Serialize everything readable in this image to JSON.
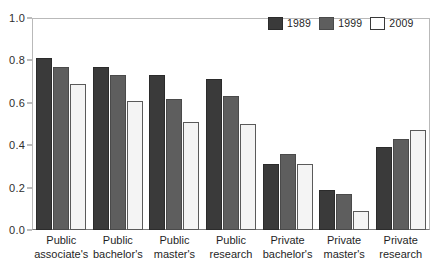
{
  "chart_data": {
    "type": "bar",
    "title": "",
    "xlabel": "",
    "ylabel": "",
    "ylim": [
      0.0,
      1.0
    ],
    "ytick_labels": [
      "1.0",
      "0.8",
      "0.6",
      "0.4",
      "0.2",
      "0.0"
    ],
    "ytick_values": [
      1.0,
      0.8,
      0.6,
      0.4,
      0.2,
      0.0
    ],
    "grid": false,
    "legend_position": "top-right",
    "categories": [
      "Public associate's",
      "Public bachelor's",
      "Public master's",
      "Public research",
      "Private bachelor's",
      "Private master's",
      "Private research"
    ],
    "category_lines": [
      [
        "Public",
        "associate's"
      ],
      [
        "Public",
        "bachelor's"
      ],
      [
        "Public",
        "master's"
      ],
      [
        "Public",
        "research"
      ],
      [
        "Private",
        "bachelor's"
      ],
      [
        "Private",
        "master's"
      ],
      [
        "Private",
        "research"
      ]
    ],
    "series": [
      {
        "name": "1989",
        "color": "#3a3a3a",
        "values": [
          0.81,
          0.77,
          0.73,
          0.71,
          0.31,
          0.19,
          0.39
        ]
      },
      {
        "name": "1999",
        "color": "#5e5e5e",
        "values": [
          0.77,
          0.73,
          0.62,
          0.63,
          0.36,
          0.17,
          0.43
        ]
      },
      {
        "name": "2009",
        "color": "#f4f4f4",
        "values": [
          0.69,
          0.61,
          0.51,
          0.5,
          0.31,
          0.09,
          0.47
        ]
      }
    ]
  },
  "legend": {
    "entries": [
      {
        "label": "1989"
      },
      {
        "label": "1999"
      },
      {
        "label": "2009"
      }
    ]
  },
  "axis": {
    "y_labels": [
      "1.0",
      "0.8",
      "0.6",
      "0.4",
      "0.2",
      "0.0"
    ]
  }
}
